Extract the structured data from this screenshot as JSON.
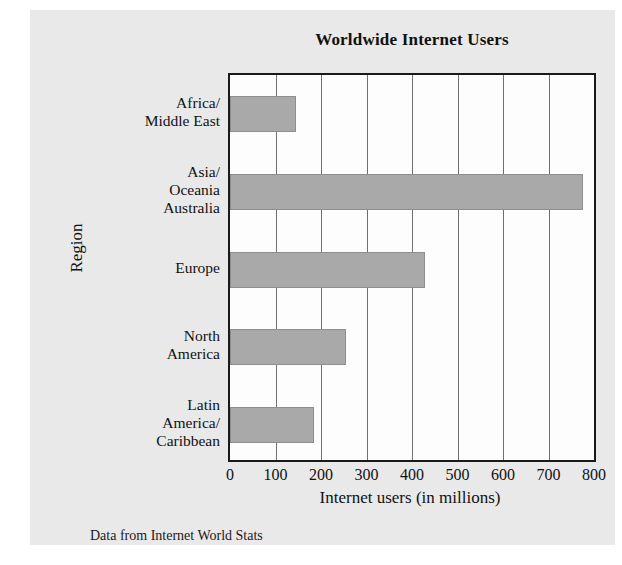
{
  "figure": {
    "title": "Worldwide Internet Users",
    "source_note": "Data from Internet World Stats",
    "panel_bg": "#e9e9e9",
    "bar_color": "#a9a9a9",
    "axis_color": "#1a1a1a",
    "grid_color": "#6f6f6f"
  },
  "chart_data": {
    "type": "bar",
    "orientation": "horizontal",
    "title": "Worldwide Internet Users",
    "subtitle": "",
    "xlabel": "Internet users (in millions)",
    "ylabel": "Region",
    "categories": [
      "Africa/\nMiddle East",
      "Asia/\nOceania\nAustralia",
      "Europe",
      "North\nAmerica",
      "Latin\nAmerica/\nCaribbean"
    ],
    "values": [
      146,
      776,
      428,
      254,
      185
    ],
    "xlim": [
      0,
      800
    ],
    "xticks": [
      0,
      100,
      200,
      300,
      400,
      500,
      600,
      700,
      800
    ],
    "xtick_labels": [
      "0",
      "100",
      "200",
      "300",
      "400",
      "500",
      "600",
      "700",
      "800"
    ],
    "grid": "vertical",
    "legend": "none",
    "annotations": [
      "Data from Internet World Stats"
    ]
  },
  "categories": [
    {
      "lines": [
        "Africa/",
        "Middle East"
      ],
      "value": 146
    },
    {
      "lines": [
        "Asia/",
        "Oceania",
        "Australia"
      ],
      "value": 776
    },
    {
      "lines": [
        "Europe"
      ],
      "value": 428
    },
    {
      "lines": [
        "North",
        "America"
      ],
      "value": 254
    },
    {
      "lines": [
        "Latin",
        "America/",
        "Caribbean"
      ],
      "value": 185
    }
  ]
}
